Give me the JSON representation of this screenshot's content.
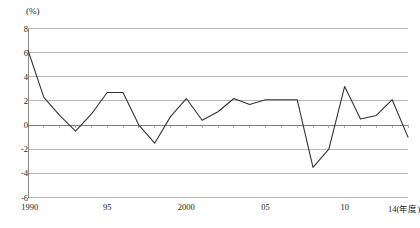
{
  "chart_data": {
    "type": "line",
    "title": "",
    "subtitle": "",
    "xlabel": "14(年度)",
    "ylabel": "(%)",
    "unit_label": "(%)",
    "grid": true,
    "legend": "none",
    "xlim": [
      1990,
      2014
    ],
    "ylim": [
      -6,
      8
    ],
    "yticks": [
      8,
      6,
      4,
      2,
      0,
      -2,
      -4,
      -6
    ],
    "ytick_labels": [
      "8",
      "6",
      "4",
      "2",
      "0",
      "-2",
      "-4",
      "-6"
    ],
    "xticks": [
      1990,
      1995,
      2000,
      2005,
      2010,
      2014
    ],
    "xtick_labels": [
      "1990",
      "95",
      "2000",
      "05",
      "10",
      "14(年度)"
    ],
    "x": [
      1990,
      1991,
      1992,
      1993,
      1994,
      1995,
      1996,
      1997,
      1998,
      1999,
      2000,
      2001,
      2002,
      2003,
      2004,
      2005,
      2006,
      2007,
      2008,
      2009,
      2010,
      2011,
      2012,
      2013,
      2014
    ],
    "series": [
      {
        "name": "実質経済成長率",
        "color": "#333333",
        "values": [
          6.2,
          2.3,
          0.8,
          -0.5,
          0.9,
          2.7,
          2.7,
          0.0,
          -1.5,
          0.7,
          2.2,
          0.4,
          1.1,
          2.2,
          1.7,
          2.1,
          2.1,
          2.1,
          -3.5,
          -2.0,
          3.2,
          0.5,
          0.8,
          2.1,
          -1.0
        ]
      }
    ]
  },
  "axes": {
    "zero_line_value": 0
  }
}
